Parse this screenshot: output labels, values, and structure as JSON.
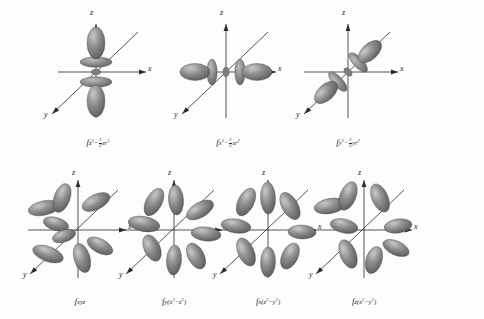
{
  "figure": {
    "background_color": "#fdfdfb",
    "lobe_color": "#8a8a8a",
    "lobe_color_dark": "#6d6d6d",
    "lobe_color_light": "#b4b4b4",
    "axis_color": "#2a2a2a",
    "label_color": "#1c1c1c"
  },
  "axes": {
    "x_label": "x",
    "y_label": "y",
    "z_label": "z"
  },
  "orbitals": [
    {
      "id": "fz3",
      "row": 1,
      "col": 1,
      "base": "f",
      "sub_text": "z3 - 3/5 zr2",
      "sub_parts": {
        "term1_var": "z",
        "term1_exp": "3",
        "minus": "−",
        "frac_num": "3",
        "frac_den": "5",
        "term2_var": "zr",
        "term2_exp": "2"
      },
      "shape": "dumbbell-z-with-rings",
      "axis_of_lobes": "z"
    },
    {
      "id": "fx3",
      "row": 1,
      "col": 2,
      "base": "f",
      "sub_text": "x3 - 3/5 xr2",
      "sub_parts": {
        "term1_var": "x",
        "term1_exp": "3",
        "minus": "−",
        "frac_num": "3",
        "frac_den": "5",
        "term2_var": "xr",
        "term2_exp": "2"
      },
      "shape": "dumbbell-x-with-rings",
      "axis_of_lobes": "x"
    },
    {
      "id": "fy3",
      "row": 1,
      "col": 3,
      "base": "f",
      "sub_text": "y3 - 3/5 yr2",
      "sub_parts": {
        "term1_var": "y",
        "term1_exp": "3",
        "minus": "−",
        "frac_num": "3",
        "frac_den": "5",
        "term2_var": "yr",
        "term2_exp": "2"
      },
      "shape": "dumbbell-y-with-rings",
      "axis_of_lobes": "y"
    },
    {
      "id": "fxyz",
      "row": 2,
      "col": 1,
      "base": "f",
      "sub_text": "xyz",
      "sub_parts": {
        "plain": "xyz"
      },
      "shape": "eight-lobe",
      "axis_of_lobes": "diagonal"
    },
    {
      "id": "fy_x2_z2",
      "row": 2,
      "col": 2,
      "base": "f",
      "sub_text": "y(x2 - z2)",
      "sub_parts": {
        "prefix": "y(",
        "v1": "x",
        "e1": "2",
        "minus": "−",
        "v2": "z",
        "e2": "2",
        "suffix": ")"
      },
      "shape": "six-lobe",
      "axis_of_lobes": "xz-plane"
    },
    {
      "id": "fx_z2_y2",
      "row": 2,
      "col": 3,
      "base": "f",
      "sub_text": "x(z2 - y2)",
      "sub_parts": {
        "prefix": "x(",
        "v1": "z",
        "e1": "2",
        "minus": "−",
        "v2": "y",
        "e2": "2",
        "suffix": ")"
      },
      "shape": "six-lobe",
      "axis_of_lobes": "yz-plane"
    },
    {
      "id": "fz_x2_y2",
      "row": 2,
      "col": 4,
      "base": "f",
      "sub_text": "z(x2 - y2)",
      "sub_parts": {
        "prefix": "z(",
        "v1": "x",
        "e1": "2",
        "minus": "−",
        "v2": "y",
        "e2": "2",
        "suffix": ")"
      },
      "shape": "six-lobe",
      "axis_of_lobes": "xy-plane"
    }
  ]
}
